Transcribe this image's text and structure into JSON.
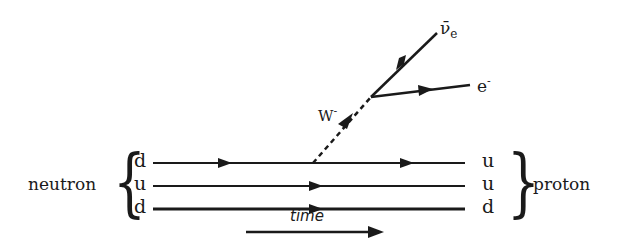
{
  "diagram": {
    "type": "feynman-diagram",
    "initial": {
      "label": "neutron",
      "quarks": [
        "d",
        "u",
        "d"
      ]
    },
    "final": {
      "label": "proton",
      "quarks": [
        "u",
        "u",
        "d"
      ]
    },
    "boson": {
      "label": "W",
      "charge": "-"
    },
    "products": [
      {
        "label": "ν̄",
        "subscript": "e",
        "name": "electron antineutrino"
      },
      {
        "label": "e",
        "charge": "-",
        "name": "electron"
      }
    ],
    "axis": {
      "label": "time"
    }
  }
}
